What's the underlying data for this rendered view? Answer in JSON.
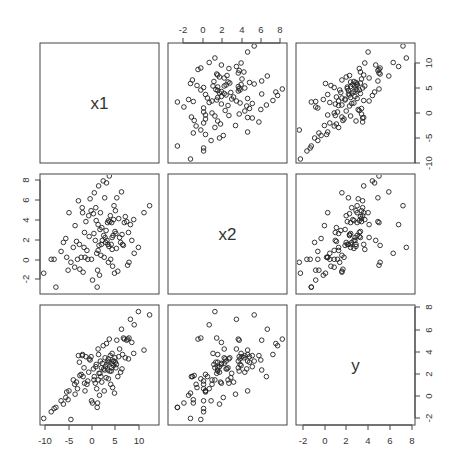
{
  "chart_data": {
    "type": "scatter",
    "subtype": "scatterplot-matrix",
    "title": "",
    "variables": [
      "x1",
      "x2",
      "y"
    ],
    "diagonal_labels": [
      "x1",
      "x2",
      "y"
    ],
    "axis_ranges": {
      "x1": [
        -11,
        14
      ],
      "x2": [
        -3.2,
        8.5
      ],
      "y": [
        -2.8,
        8.2
      ],
      "y_in_row1": [
        -11,
        14
      ]
    },
    "ticks": {
      "x1": [
        "-10",
        "-5",
        "0",
        "5",
        "10"
      ],
      "x2": [
        "-2",
        "0",
        "2",
        "4",
        "6",
        "8"
      ],
      "y_row1": [
        "-10",
        "-5",
        "0",
        "5",
        "10"
      ],
      "y_row3": [
        "-2",
        "0",
        "2",
        "4",
        "6",
        "8"
      ]
    },
    "axis_placement": {
      "top": "column 2 (x2)",
      "right_row1": "row 1 (y scale -10..10)",
      "left_row2": "row 2 (x2)",
      "right_row3": "row 3 (y)",
      "bottom_col1": "column 1 (x1)",
      "bottom_col3": "column 3 (x2)"
    },
    "grid": false,
    "legend": "none",
    "marker": "open circle",
    "points": [
      {
        "x1": -10.2,
        "x2": -1.6,
        "y": -2.2
      },
      {
        "x1": -8.6,
        "x2": -0.2,
        "y": -1.6
      },
      {
        "x1": -8.0,
        "x2": -0.2,
        "y": -1.3
      },
      {
        "x1": -7.6,
        "x2": -3.0,
        "y": -1.2
      },
      {
        "x1": -6.5,
        "x2": 0.6,
        "y": -0.6
      },
      {
        "x1": -6.0,
        "x2": 1.5,
        "y": -0.9
      },
      {
        "x1": -5.5,
        "x2": 1.9,
        "y": -0.3
      },
      {
        "x1": -5.3,
        "x2": 0.0,
        "y": 0.2
      },
      {
        "x1": -5.0,
        "x2": -1.3,
        "y": -0.5
      },
      {
        "x1": -4.8,
        "x2": 4.5,
        "y": 0.3
      },
      {
        "x1": -4.4,
        "x2": -0.5,
        "y": -2.3
      },
      {
        "x1": -3.9,
        "x2": 1.0,
        "y": 1.3
      },
      {
        "x1": -3.6,
        "x2": -1.0,
        "y": 0.9
      },
      {
        "x1": -3.2,
        "x2": 1.6,
        "y": 1.1
      },
      {
        "x1": -3.0,
        "x2": -0.2,
        "y": 0.5
      },
      {
        "x1": -2.8,
        "x2": 5.7,
        "y": 3.5
      },
      {
        "x1": -2.6,
        "x2": 1.3,
        "y": 2.9
      },
      {
        "x1": -2.5,
        "x2": -1.2,
        "y": 1.7
      },
      {
        "x1": -2.2,
        "x2": 0.0,
        "y": 1.8
      },
      {
        "x1": -2.0,
        "x2": 5.0,
        "y": 3.5
      },
      {
        "x1": -1.9,
        "x2": 4.5,
        "y": 3.6
      },
      {
        "x1": -1.8,
        "x2": -1.5,
        "y": 1.6
      },
      {
        "x1": -1.6,
        "x2": 1.0,
        "y": 2.4
      },
      {
        "x1": -1.4,
        "x2": 0.0,
        "y": 0.3
      },
      {
        "x1": -1.2,
        "x2": 3.6,
        "y": 3.4
      },
      {
        "x1": -1.0,
        "x2": 0.7,
        "y": 0.9
      },
      {
        "x1": -0.8,
        "x2": -0.2,
        "y": 1.2
      },
      {
        "x1": -0.6,
        "x2": 4.2,
        "y": 2.0
      },
      {
        "x1": -0.3,
        "x2": 5.9,
        "y": 3.1
      },
      {
        "x1": -0.1,
        "x2": 4.7,
        "y": 3.4
      },
      {
        "x1": 0.0,
        "x2": -0.2,
        "y": -0.6
      },
      {
        "x1": 0.2,
        "x2": -2.3,
        "y": -0.8
      },
      {
        "x1": 0.4,
        "x2": 4.4,
        "y": 2.3
      },
      {
        "x1": 0.6,
        "x2": 6.5,
        "y": 1.6
      },
      {
        "x1": 0.8,
        "x2": 1.7,
        "y": 1.0
      },
      {
        "x1": 1.0,
        "x2": 3.7,
        "y": 2.7
      },
      {
        "x1": 1.1,
        "x2": 0.4,
        "y": 0.5
      },
      {
        "x1": 1.2,
        "x2": -3.0,
        "y": -1.2
      },
      {
        "x1": 1.3,
        "x2": -1.3,
        "y": -0.8
      },
      {
        "x1": 1.4,
        "x2": 0.7,
        "y": 1.3
      },
      {
        "x1": 1.5,
        "x2": 7.2,
        "y": 3.6
      },
      {
        "x1": 1.6,
        "x2": 1.2,
        "y": 1.9
      },
      {
        "x1": 1.7,
        "x2": -1.8,
        "y": -0.1
      },
      {
        "x1": 1.9,
        "x2": 4.5,
        "y": 3.0
      },
      {
        "x1": 2.1,
        "x2": 1.3,
        "y": 2.4
      },
      {
        "x1": 2.3,
        "x2": 1.7,
        "y": 2.8
      },
      {
        "x1": 2.5,
        "x2": 7.7,
        "y": 4.4
      },
      {
        "x1": 2.6,
        "x2": 2.2,
        "y": 2.3
      },
      {
        "x1": 2.7,
        "x2": 0.0,
        "y": 0.3
      },
      {
        "x1": 2.9,
        "x2": 2.0,
        "y": 3.3
      },
      {
        "x1": 3.0,
        "x2": 1.5,
        "y": 2.5
      },
      {
        "x1": 3.2,
        "x2": 7.5,
        "y": 4.6
      },
      {
        "x1": 3.3,
        "x2": 1.7,
        "y": 2.7
      },
      {
        "x1": 3.4,
        "x2": 3.5,
        "y": 3.0
      },
      {
        "x1": 3.5,
        "x2": 1.3,
        "y": 2.2
      },
      {
        "x1": 3.6,
        "x2": 3.7,
        "y": 3.2
      },
      {
        "x1": 3.7,
        "x2": 1.1,
        "y": 2.9
      },
      {
        "x1": 3.8,
        "x2": 8.2,
        "y": 5.0
      },
      {
        "x1": 3.9,
        "x2": 3.6,
        "y": 2.1
      },
      {
        "x1": 4.0,
        "x2": 4.2,
        "y": 3.5
      },
      {
        "x1": 4.1,
        "x2": -0.2,
        "y": 0.9
      },
      {
        "x1": 4.2,
        "x2": 1.3,
        "y": 2.1
      },
      {
        "x1": 4.3,
        "x2": 3.5,
        "y": 2.4
      },
      {
        "x1": 4.4,
        "x2": 2.0,
        "y": 2.8
      },
      {
        "x1": 4.5,
        "x2": -0.9,
        "y": 0.6
      },
      {
        "x1": 4.6,
        "x2": 2.2,
        "y": 3.0
      },
      {
        "x1": 4.7,
        "x2": 3.8,
        "y": 2.6
      },
      {
        "x1": 4.8,
        "x2": 5.2,
        "y": 3.0
      },
      {
        "x1": 4.9,
        "x2": -1.6,
        "y": 0.1
      },
      {
        "x1": 5.0,
        "x2": 2.6,
        "y": 3.3
      },
      {
        "x1": 5.1,
        "x2": 4.7,
        "y": 2.9
      },
      {
        "x1": 5.2,
        "x2": 2.4,
        "y": 2.4
      },
      {
        "x1": 5.4,
        "x2": 6.0,
        "y": 4.9
      },
      {
        "x1": 5.6,
        "x2": -1.4,
        "y": 1.6
      },
      {
        "x1": 5.8,
        "x2": 3.9,
        "y": 3.4
      },
      {
        "x1": 6.0,
        "x2": 2.0,
        "y": 4.1
      },
      {
        "x1": 6.2,
        "x2": 1.5,
        "y": 2.0
      },
      {
        "x1": 6.4,
        "x2": 6.6,
        "y": 5.9
      },
      {
        "x1": 6.6,
        "x2": 1.3,
        "y": 3.6
      },
      {
        "x1": 6.8,
        "x2": 1.2,
        "y": 5.1
      },
      {
        "x1": 7.0,
        "x2": 3.5,
        "y": 5.0
      },
      {
        "x1": 7.2,
        "x2": 4.1,
        "y": 3.3
      },
      {
        "x1": 7.5,
        "x2": 3.6,
        "y": 4.9
      },
      {
        "x1": 7.9,
        "x2": 2.5,
        "y": 3.2
      },
      {
        "x1": 8.0,
        "x2": -0.5,
        "y": 5.1
      },
      {
        "x1": 8.3,
        "x2": 3.3,
        "y": 6.8
      },
      {
        "x1": 8.6,
        "x2": 1.7,
        "y": 4.7
      },
      {
        "x1": 9.0,
        "x2": 3.8,
        "y": 3.7
      },
      {
        "x1": 9.1,
        "x2": 0.4,
        "y": 6.3
      },
      {
        "x1": 10.0,
        "x2": 1.0,
        "y": 7.5
      },
      {
        "x1": 11.2,
        "x2": 4.5,
        "y": 4.0
      },
      {
        "x1": 12.4,
        "x2": 5.2,
        "y": 7.2
      },
      {
        "x1": -0.5,
        "x2": 2.1,
        "y": 3.2
      },
      {
        "x1": 0.5,
        "x2": 2.4,
        "y": 1.3
      },
      {
        "x1": 1.8,
        "x2": 2.8,
        "y": 1.9
      },
      {
        "x1": 2.2,
        "x2": 3.0,
        "y": 1.1
      },
      {
        "x1": 3.1,
        "x2": 2.7,
        "y": 1.5
      },
      {
        "x1": -1.5,
        "x2": 2.5,
        "y": 1.0
      },
      {
        "x1": 0.9,
        "x2": 5.0,
        "y": 2.5
      },
      {
        "x1": 6.5,
        "x2": 2.3,
        "y": 2.3
      },
      {
        "x1": 2.0,
        "x2": 0.2,
        "y": 1.6
      },
      {
        "x1": 4.4,
        "x2": 0.8,
        "y": 3.7
      },
      {
        "x1": 5.3,
        "x2": 0.9,
        "y": 2.7
      },
      {
        "x1": -3.5,
        "x2": 3.2,
        "y": 0.0
      },
      {
        "x1": 7.7,
        "x2": -0.8,
        "y": 5.0
      },
      {
        "x1": 2.8,
        "x2": 6.0,
        "y": 2.2
      },
      {
        "x1": 3.6,
        "x2": -0.5,
        "y": 1.4
      },
      {
        "x1": 1.4,
        "x2": 3.3,
        "y": 4.1
      }
    ]
  }
}
